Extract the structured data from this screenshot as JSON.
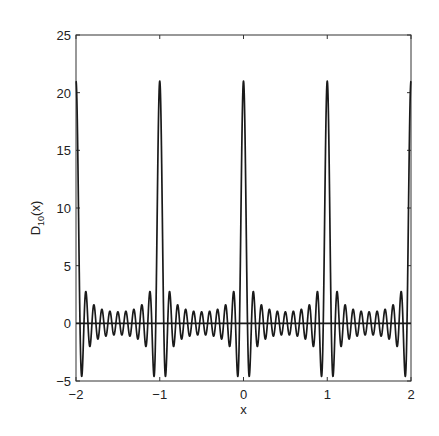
{
  "chart_data": {
    "type": "line",
    "title": "",
    "xlabel": "x",
    "ylabel": "D_{10}(x)",
    "ylabel_parts": {
      "base": "D",
      "subscript": "10",
      "suffix": "(x)"
    },
    "function": "D_10(x) = sin(21*pi*x) / sin(pi*x)  (Dirichlet kernel, N = 10, period 1)",
    "N": 10,
    "xlim": [
      -2,
      2
    ],
    "ylim": [
      -5,
      25
    ],
    "xticks": [
      -2,
      -1,
      0,
      1,
      2
    ],
    "yticks": [
      -5,
      0,
      5,
      10,
      15,
      20,
      25
    ],
    "xtick_labels": [
      "−2",
      "−1",
      "0",
      "1",
      "2"
    ],
    "ytick_labels": [
      "−5",
      "0",
      "5",
      "10",
      "15",
      "20",
      "25"
    ],
    "grid": false,
    "legend": null,
    "zero_line": true,
    "series": [
      {
        "name": "D_10(x)",
        "color": "#1a1a1a",
        "samples": 4001,
        "peaks": [
          {
            "x": -2,
            "y": 21
          },
          {
            "x": -1,
            "y": 21
          },
          {
            "x": 0,
            "y": 21
          },
          {
            "x": 1,
            "y": 21
          },
          {
            "x": 2,
            "y": 21
          }
        ],
        "key_points": [
          {
            "x": 0.0,
            "y": 21.0
          },
          {
            "x": 0.0476,
            "y": 0.0
          },
          {
            "x": 0.068,
            "y": -4.62
          },
          {
            "x": 0.0952,
            "y": 0.0
          },
          {
            "x": 0.1167,
            "y": 2.73
          },
          {
            "x": 0.1429,
            "y": 0.0
          },
          {
            "x": 0.165,
            "y": -2.0
          },
          {
            "x": 0.213,
            "y": 1.68
          },
          {
            "x": 0.261,
            "y": -1.46
          },
          {
            "x": 0.3095,
            "y": 1.33
          },
          {
            "x": 0.3571,
            "y": -1.23
          },
          {
            "x": 0.4048,
            "y": 1.15
          },
          {
            "x": 0.4524,
            "y": -1.11
          },
          {
            "x": 0.5,
            "y": 1.0
          },
          {
            "x": 0.5476,
            "y": -1.11
          },
          {
            "x": 0.5952,
            "y": 1.15
          },
          {
            "x": 0.6429,
            "y": -1.23
          },
          {
            "x": 0.6905,
            "y": 1.33
          },
          {
            "x": 0.739,
            "y": -1.46
          },
          {
            "x": 0.787,
            "y": 1.68
          },
          {
            "x": 0.835,
            "y": -2.0
          },
          {
            "x": 0.8833,
            "y": 2.73
          },
          {
            "x": 0.932,
            "y": -4.62
          },
          {
            "x": 1.0,
            "y": 21.0
          }
        ]
      }
    ]
  },
  "layout": {
    "plot_box": {
      "left": 76,
      "top": 35,
      "right": 411,
      "bottom": 381
    },
    "line_color": "#1a1a1a",
    "axis_color": "#333333"
  }
}
